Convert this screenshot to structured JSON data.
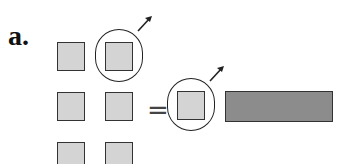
{
  "figure": {
    "label": "a.",
    "equals_sign": "=",
    "colors": {
      "light_square": "#d4d4d4",
      "dark_bar": "#8c8c8c",
      "stroke": "#333333"
    },
    "left_grid": {
      "rows": 3,
      "cols": 2,
      "circled_cell": "row1-col2"
    },
    "right_side": {
      "circled_squares": 1,
      "dark_bars": 1
    }
  }
}
